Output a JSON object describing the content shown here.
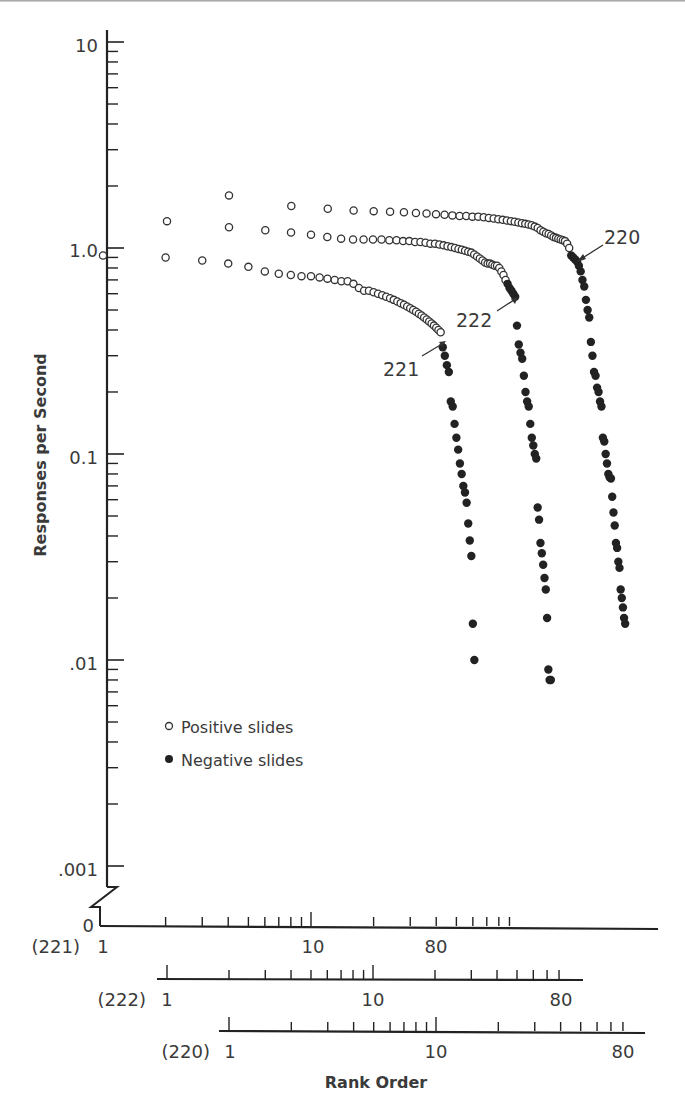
{
  "chart_data": {
    "type": "scatter",
    "title": "",
    "ylabel": "Responses per Second",
    "xlabel": "Rank Order",
    "yscale": "log",
    "ylim": [
      0.001,
      10
    ],
    "y_ticks": [
      "10",
      "1.0",
      "0.1",
      ".01",
      ".001",
      "0"
    ],
    "x_axes": [
      {
        "subject": "221",
        "label": "(221)",
        "ticks": [
          "1",
          "10",
          "80"
        ],
        "range": [
          1,
          100
        ]
      },
      {
        "subject": "222",
        "label": "(222)",
        "ticks": [
          "1",
          "10",
          "80"
        ],
        "range": [
          1,
          100
        ]
      },
      {
        "subject": "220",
        "label": "(220)",
        "ticks": [
          "1",
          "10",
          "80"
        ],
        "range": [
          1,
          100
        ]
      }
    ],
    "legend": [
      {
        "marker": "open-circle",
        "label": "Positive slides"
      },
      {
        "marker": "filled-circle",
        "label": "Negative slides"
      }
    ],
    "annotations": [
      {
        "text": "220",
        "points_to": "transition point of subject 220"
      },
      {
        "text": "222",
        "points_to": "transition point of subject 222"
      },
      {
        "text": "221",
        "points_to": "transition point of subject 221"
      }
    ],
    "series": [
      {
        "name": "221",
        "positive": {
          "rank": [
            1,
            2,
            3,
            4,
            5,
            6,
            7,
            8,
            9,
            10,
            11,
            12,
            13,
            14,
            15,
            16,
            17,
            18,
            19,
            20,
            21,
            22,
            23,
            24,
            25,
            26,
            27,
            28,
            29,
            30,
            31,
            32,
            33,
            34,
            35,
            36,
            37,
            38,
            39,
            40,
            41,
            42
          ],
          "rate": [
            0.92,
            0.9,
            0.87,
            0.84,
            0.81,
            0.77,
            0.75,
            0.74,
            0.73,
            0.73,
            0.72,
            0.71,
            0.7,
            0.69,
            0.69,
            0.67,
            0.64,
            0.62,
            0.62,
            0.61,
            0.6,
            0.59,
            0.58,
            0.57,
            0.56,
            0.55,
            0.54,
            0.53,
            0.52,
            0.51,
            0.5,
            0.49,
            0.48,
            0.47,
            0.46,
            0.45,
            0.44,
            0.43,
            0.42,
            0.41,
            0.4,
            0.39
          ]
        },
        "negative": {
          "rank": [
            43,
            44,
            45,
            46,
            47,
            48,
            49,
            50,
            51,
            52,
            53,
            54,
            55,
            56,
            57,
            58,
            59,
            60,
            61
          ],
          "rate": [
            0.33,
            0.3,
            0.27,
            0.25,
            0.18,
            0.17,
            0.14,
            0.12,
            0.105,
            0.09,
            0.08,
            0.07,
            0.065,
            0.058,
            0.046,
            0.038,
            0.032,
            0.015,
            0.01
          ]
        }
      },
      {
        "name": "222",
        "positive": {
          "rank": [
            1,
            2,
            3,
            4,
            5,
            6,
            7,
            8,
            9,
            10,
            11,
            12,
            13,
            14,
            15,
            16,
            17,
            18,
            19,
            20,
            21,
            22,
            23,
            24,
            25,
            26,
            27,
            28,
            29,
            30,
            31,
            32,
            33,
            34,
            35,
            36,
            37,
            38,
            39,
            40,
            41,
            42,
            43,
            44
          ],
          "rate": [
            1.35,
            1.26,
            1.22,
            1.19,
            1.16,
            1.13,
            1.11,
            1.1,
            1.1,
            1.1,
            1.1,
            1.09,
            1.09,
            1.08,
            1.08,
            1.07,
            1.07,
            1.06,
            1.05,
            1.05,
            1.04,
            1.03,
            1.02,
            1.01,
            1.0,
            0.99,
            0.98,
            0.97,
            0.96,
            0.95,
            0.93,
            0.91,
            0.89,
            0.87,
            0.85,
            0.84,
            0.84,
            0.83,
            0.82,
            0.82,
            0.8,
            0.77,
            0.74,
            0.7
          ]
        },
        "negative": {
          "rank": [
            45,
            46,
            47,
            48,
            49,
            50,
            51,
            52,
            53,
            54,
            55,
            56,
            57,
            58,
            59,
            60,
            61,
            62,
            63,
            64,
            65,
            66,
            67,
            68,
            69,
            70,
            71,
            72,
            73
          ],
          "rate": [
            0.67,
            0.64,
            0.62,
            0.6,
            0.58,
            0.42,
            0.34,
            0.31,
            0.29,
            0.24,
            0.2,
            0.18,
            0.17,
            0.14,
            0.12,
            0.11,
            0.1,
            0.095,
            0.055,
            0.048,
            0.037,
            0.033,
            0.029,
            0.025,
            0.022,
            0.016,
            0.009,
            0.008,
            0.008
          ]
        }
      },
      {
        "name": "220",
        "positive": {
          "rank": [
            1,
            2,
            3,
            4,
            5,
            6,
            7,
            8,
            9,
            10,
            11,
            12,
            13,
            14,
            15,
            16,
            17,
            18,
            19,
            20,
            21,
            22,
            23,
            24,
            25,
            26,
            27,
            28,
            29,
            30,
            31,
            32,
            33,
            34,
            35,
            36,
            37,
            38,
            39,
            40,
            41,
            42,
            43,
            44
          ],
          "rate": [
            1.8,
            1.6,
            1.55,
            1.52,
            1.51,
            1.5,
            1.49,
            1.48,
            1.47,
            1.46,
            1.45,
            1.44,
            1.43,
            1.43,
            1.42,
            1.42,
            1.41,
            1.4,
            1.39,
            1.38,
            1.37,
            1.36,
            1.35,
            1.34,
            1.33,
            1.32,
            1.31,
            1.3,
            1.29,
            1.27,
            1.25,
            1.22,
            1.2,
            1.18,
            1.17,
            1.15,
            1.13,
            1.12,
            1.11,
            1.1,
            1.09,
            1.08,
            1.05,
            1.0
          ]
        },
        "negative": {
          "rank": [
            45,
            46,
            47,
            48,
            49,
            50,
            51,
            52,
            53,
            54,
            55,
            56,
            57,
            58,
            59,
            60,
            61,
            62,
            63,
            64,
            65,
            66,
            67,
            68,
            69,
            70,
            71,
            72,
            73,
            74,
            75,
            76,
            77,
            78,
            79,
            80,
            81,
            82
          ],
          "rate": [
            0.92,
            0.9,
            0.88,
            0.86,
            0.82,
            0.77,
            0.7,
            0.65,
            0.56,
            0.5,
            0.46,
            0.35,
            0.3,
            0.25,
            0.24,
            0.21,
            0.2,
            0.18,
            0.17,
            0.12,
            0.115,
            0.1,
            0.09,
            0.08,
            0.077,
            0.076,
            0.062,
            0.052,
            0.045,
            0.037,
            0.035,
            0.03,
            0.028,
            0.022,
            0.02,
            0.018,
            0.016,
            0.015
          ]
        }
      }
    ]
  },
  "labels": {
    "y_axis_title": "Responses per Second",
    "x_axis_title": "Rank Order",
    "legend_positive": "Positive slides",
    "legend_negative": "Negative slides",
    "ann_220": "220",
    "ann_222": "222",
    "ann_221": "221",
    "y10": "10",
    "y1": "1.0",
    "y01": "0.1",
    "y001": ".01",
    "y0001": ".001",
    "y0": "0",
    "ax221": "(221)",
    "ax222": "(222)",
    "ax220": "(220)",
    "tick1": "1",
    "tick10": "10",
    "tick80": "80"
  }
}
